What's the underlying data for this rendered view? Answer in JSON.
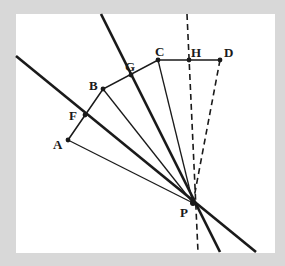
{
  "diagram": {
    "background": "#d8d8d8",
    "panel": {
      "x": 16,
      "y": 14,
      "w": 259,
      "h": 239,
      "fill": "#ffffff"
    },
    "stroke_color": "#1a1a1a",
    "points": {
      "A": {
        "x": 68,
        "y": 140,
        "label": "A",
        "lx": 53,
        "ly": 149
      },
      "B": {
        "x": 103,
        "y": 89,
        "label": "B",
        "lx": 89,
        "ly": 90
      },
      "C": {
        "x": 158,
        "y": 60,
        "label": "C",
        "lx": 155,
        "ly": 56
      },
      "D": {
        "x": 220,
        "y": 60,
        "label": "D",
        "lx": 224,
        "ly": 57
      },
      "F": {
        "x": 85,
        "y": 115,
        "label": "F",
        "lx": 69,
        "ly": 120
      },
      "G": {
        "x": 131,
        "y": 75,
        "label": "G",
        "lx": 125,
        "ly": 71
      },
      "H": {
        "x": 189,
        "y": 60,
        "label": "H",
        "lx": 191,
        "ly": 57
      },
      "P": {
        "x": 193,
        "y": 203,
        "label": "P",
        "lx": 180,
        "ly": 217
      }
    },
    "polyline_ABCD": [
      "A",
      "B",
      "C",
      "D"
    ],
    "thin_rays_to_P": [
      "A",
      "B",
      "C"
    ],
    "dashed_rays_to_P": [
      "D"
    ],
    "thick_lines": [
      {
        "name": "line-through-F",
        "x1": 16,
        "y1": 56,
        "x2": 256,
        "y2": 252
      },
      {
        "name": "line-through-G",
        "x1": 101,
        "y1": 14,
        "x2": 220,
        "y2": 252
      }
    ],
    "dashed_lines": [
      {
        "name": "line-through-H",
        "x1": 187,
        "y1": 14,
        "x2": 198,
        "y2": 252
      }
    ]
  }
}
